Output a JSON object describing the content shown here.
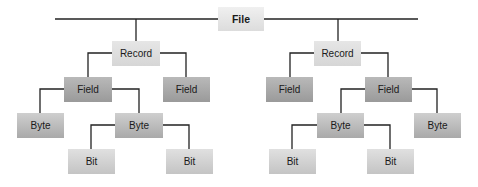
{
  "diagram": {
    "root": {
      "label": "File"
    },
    "left_record": {
      "label": "Record",
      "field_a": {
        "label": "Field"
      },
      "field_b": {
        "label": "Field"
      },
      "byte_a": {
        "label": "Byte"
      },
      "byte_b": {
        "label": "Byte"
      },
      "bit_a": {
        "label": "Bit"
      },
      "bit_b": {
        "label": "Bit"
      }
    },
    "right_record": {
      "label": "Record",
      "field_a": {
        "label": "Field"
      },
      "field_b": {
        "label": "Field"
      },
      "byte_a": {
        "label": "Byte"
      },
      "byte_b": {
        "label": "Byte"
      },
      "bit_a": {
        "label": "Bit"
      },
      "bit_b": {
        "label": "Bit"
      }
    },
    "colors": {
      "line": "#222222",
      "file": "#e6e6e6",
      "record": "#dedede",
      "field": "#a8a8a8",
      "byte": "#bcbcbc",
      "bit": "#d2d2d2"
    }
  }
}
